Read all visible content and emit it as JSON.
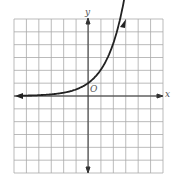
{
  "chart_data": {
    "type": "line",
    "title": "",
    "xlabel": "x",
    "ylabel": "y",
    "origin_label": "O",
    "xlim": [
      -6,
      6
    ],
    "ylim": [
      -6,
      6
    ],
    "grid": true,
    "series": [
      {
        "name": "exponential curve",
        "x": [
          -6,
          -4,
          -3,
          -2,
          -1,
          0,
          1,
          2,
          3
        ],
        "y": [
          0.02,
          0.06,
          0.125,
          0.25,
          0.5,
          1,
          2,
          4,
          8
        ]
      }
    ]
  },
  "labels": {
    "x": "x",
    "y": "y",
    "origin": "O"
  }
}
